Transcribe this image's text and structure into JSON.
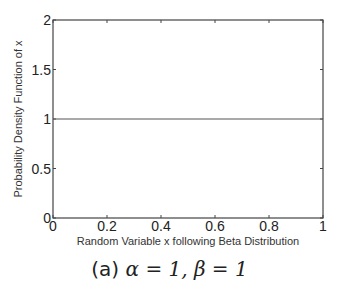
{
  "chart_data": {
    "type": "line",
    "title": "",
    "xlabel": "Random Variable x following Beta Distribution",
    "ylabel": "Probability Density Function of x",
    "xlim": [
      0,
      1
    ],
    "ylim": [
      0,
      2
    ],
    "xticks": [
      0,
      0.2,
      0.4,
      0.6,
      0.8,
      1
    ],
    "xtick_labels": [
      "0",
      "0.2",
      "0.4",
      "0.6",
      "0.8",
      "1"
    ],
    "yticks": [
      0,
      0.5,
      1,
      1.5,
      2
    ],
    "ytick_labels": [
      "0",
      "0.5",
      "1",
      "1.5",
      "2"
    ],
    "grid": false,
    "legend": null,
    "series": [
      {
        "name": "Beta(1,1) PDF",
        "color": "#555555",
        "x": [
          0,
          1
        ],
        "y": [
          1,
          1
        ]
      }
    ],
    "caption": "(a) α = 1, β = 1"
  },
  "caption": {
    "prefix": "(a) ",
    "math": "α = 1, β = 1"
  }
}
